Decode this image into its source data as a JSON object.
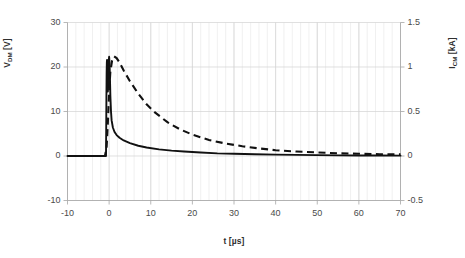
{
  "chart_data": {
    "type": "line",
    "title": "",
    "xlabel": "t [µs]",
    "xlim": [
      -10,
      70
    ],
    "x_ticks": [
      -10,
      0,
      10,
      20,
      30,
      40,
      50,
      60,
      70
    ],
    "x_minor_step": 2,
    "grid": true,
    "legend": "none",
    "axes": [
      {
        "id": "left",
        "label_plain": "V_DM [V]",
        "label_main": "V",
        "label_sub": "DM",
        "label_unit": " [V]",
        "ylim": [
          -10,
          30
        ],
        "ticks": [
          30,
          20,
          10,
          0,
          -10
        ]
      },
      {
        "id": "right",
        "label_plain": "I_CM [kA]",
        "label_main": "I",
        "label_sub": "CM",
        "label_unit": " [kA]",
        "ylim": [
          -0.5,
          1.5
        ],
        "ticks": [
          1.5,
          1,
          0.5,
          0,
          -0.5
        ]
      }
    ],
    "series": [
      {
        "name": "V_DM",
        "axis": "left",
        "style": "solid",
        "color": "#111111",
        "unit": "V",
        "points": [
          [
            -10,
            0
          ],
          [
            -6,
            0
          ],
          [
            -3,
            0
          ],
          [
            -1.0,
            0
          ],
          [
            -0.75,
            0
          ],
          [
            -0.7,
            6
          ],
          [
            -0.65,
            13
          ],
          [
            -0.6,
            18.5
          ],
          [
            -0.55,
            21.0
          ],
          [
            -0.5,
            21.6
          ],
          [
            -0.42,
            20.2
          ],
          [
            -0.35,
            17.0
          ],
          [
            -0.3,
            14.5
          ],
          [
            -0.25,
            15.5
          ],
          [
            -0.18,
            19.0
          ],
          [
            -0.1,
            21.4
          ],
          [
            0.0,
            22.3
          ],
          [
            0.1,
            21.0
          ],
          [
            0.2,
            17.5
          ],
          [
            0.3,
            13.5
          ],
          [
            0.45,
            10.0
          ],
          [
            0.6,
            8.0
          ],
          [
            0.9,
            6.4
          ],
          [
            1.3,
            5.4
          ],
          [
            1.8,
            4.7
          ],
          [
            2.5,
            4.1
          ],
          [
            3.5,
            3.5
          ],
          [
            5,
            2.9
          ],
          [
            7,
            2.3
          ],
          [
            9,
            1.9
          ],
          [
            12,
            1.5
          ],
          [
            15,
            1.2
          ],
          [
            18,
            1.0
          ],
          [
            22,
            0.8
          ],
          [
            26,
            0.6
          ],
          [
            30,
            0.5
          ],
          [
            35,
            0.4
          ],
          [
            40,
            0.3
          ],
          [
            45,
            0.25
          ],
          [
            50,
            0.2
          ],
          [
            55,
            0.15
          ],
          [
            60,
            0.12
          ],
          [
            65,
            0.1
          ],
          [
            70,
            0.08
          ]
        ]
      },
      {
        "name": "I_CM",
        "axis": "right",
        "style": "dashed",
        "color": "#111111",
        "unit": "kA",
        "points": [
          [
            -10,
            0
          ],
          [
            -4,
            0
          ],
          [
            -1,
            0
          ],
          [
            -0.6,
            0.1
          ],
          [
            -0.3,
            0.38
          ],
          [
            0.0,
            0.72
          ],
          [
            0.3,
            0.95
          ],
          [
            0.7,
            1.07
          ],
          [
            1.2,
            1.12
          ],
          [
            1.8,
            1.1
          ],
          [
            2.5,
            1.05
          ],
          [
            3.5,
            0.96
          ],
          [
            5,
            0.84
          ],
          [
            7,
            0.7
          ],
          [
            9,
            0.58
          ],
          [
            11,
            0.49
          ],
          [
            14,
            0.38
          ],
          [
            17,
            0.3
          ],
          [
            20,
            0.24
          ],
          [
            24,
            0.18
          ],
          [
            28,
            0.14
          ],
          [
            32,
            0.11
          ],
          [
            36,
            0.085
          ],
          [
            40,
            0.065
          ],
          [
            45,
            0.05
          ],
          [
            50,
            0.04
          ],
          [
            55,
            0.03
          ],
          [
            60,
            0.025
          ],
          [
            65,
            0.02
          ],
          [
            70,
            0.018
          ]
        ]
      }
    ]
  },
  "colors": {
    "series": "#111111",
    "grid_minor": "#e9e9e9",
    "grid_major": "#d2d2d2",
    "axis": "#a6a6a6",
    "text": "#3a3a3a",
    "background": "#ffffff"
  }
}
